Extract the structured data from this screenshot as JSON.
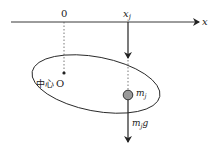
{
  "diagram": {
    "axis": {
      "label": "x",
      "origin_label": "0",
      "position_label": "x",
      "position_subscript": "j"
    },
    "body": {
      "center_label_cn": "中心",
      "center_label": "O"
    },
    "mass": {
      "label": "m",
      "subscript": "j"
    },
    "force": {
      "label_m": "m",
      "label_sub": "j",
      "label_g": "g"
    },
    "colors": {
      "line": "#222222",
      "mass_fill": "#9a9a9a",
      "dotted": "#555555"
    }
  }
}
